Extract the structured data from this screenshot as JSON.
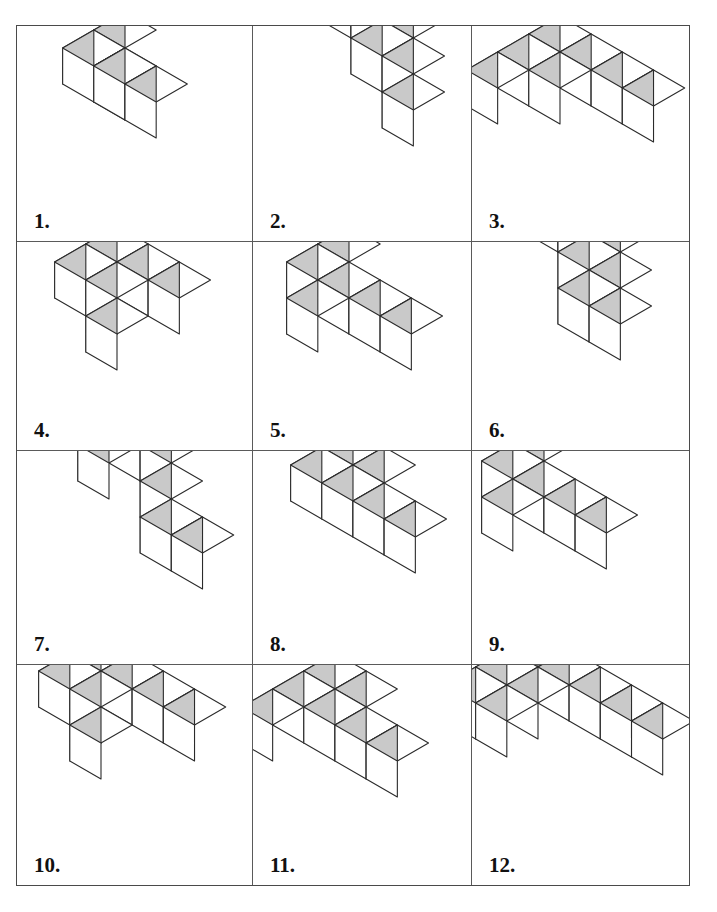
{
  "page": {
    "background_color": "#ffffff",
    "border_color": "#4a4a4a",
    "grid_line_color": "#5a5a5a"
  },
  "figure_style": {
    "top_face_color": "#ffffff",
    "left_face_color": "#c9c9c9",
    "right_face_color": "#ffffff",
    "edge_color": "#2b2b2b",
    "edge_width": 1.1,
    "cube_size_px": 36
  },
  "grid": {
    "columns": 3,
    "rows": 4,
    "cells": [
      {
        "label": "1.",
        "name": "figure-1",
        "origin": [
          108,
          58
        ],
        "cube": 36,
        "voxels": [
          [
            0,
            0,
            1
          ],
          [
            0,
            1,
            1
          ],
          [
            1,
            1,
            1
          ],
          [
            2,
            1,
            1
          ],
          [
            0,
            0,
            0
          ]
        ]
      },
      {
        "label": "2.",
        "name": "figure-2",
        "origin": [
          98,
          48
        ],
        "cube": 36,
        "voxels": [
          [
            0,
            0,
            2
          ],
          [
            1,
            0,
            2
          ],
          [
            2,
            0,
            2
          ],
          [
            1,
            0,
            1
          ],
          [
            2,
            0,
            1
          ],
          [
            2,
            0,
            0
          ]
        ]
      },
      {
        "label": "3.",
        "name": "figure-3",
        "origin": [
          88,
          62
        ],
        "cube": 36,
        "voxels": [
          [
            0,
            2,
            1
          ],
          [
            0,
            1,
            1
          ],
          [
            0,
            0,
            1
          ],
          [
            1,
            0,
            1
          ],
          [
            2,
            0,
            1
          ],
          [
            3,
            0,
            1
          ],
          [
            0,
            0,
            0
          ]
        ]
      },
      {
        "label": "4.",
        "name": "figure-4",
        "origin": [
          100,
          56
        ],
        "cube": 36,
        "voxels": [
          [
            0,
            1,
            1
          ],
          [
            0,
            0,
            1
          ],
          [
            1,
            0,
            1
          ],
          [
            2,
            0,
            1
          ],
          [
            0,
            0,
            0
          ],
          [
            0,
            0,
            -1
          ]
        ]
      },
      {
        "label": "5.",
        "name": "figure-5",
        "origin": [
          96,
          56
        ],
        "cube": 36,
        "voxels": [
          [
            0,
            1,
            1
          ],
          [
            0,
            0,
            1
          ],
          [
            0,
            1,
            0
          ],
          [
            0,
            0,
            0
          ],
          [
            1,
            0,
            0
          ],
          [
            2,
            0,
            0
          ]
        ]
      },
      {
        "label": "6.",
        "name": "figure-6",
        "origin": [
          86,
          46
        ],
        "cube": 36,
        "voxels": [
          [
            0,
            0,
            2
          ],
          [
            1,
            0,
            2
          ],
          [
            2,
            0,
            2
          ],
          [
            1,
            0,
            1
          ],
          [
            2,
            0,
            1
          ],
          [
            1,
            0,
            0
          ],
          [
            2,
            0,
            0
          ]
        ]
      },
      {
        "label": "7.",
        "name": "figure-7",
        "origin": [
          92,
          48
        ],
        "cube": 36,
        "voxels": [
          [
            0,
            0,
            2
          ],
          [
            1,
            0,
            2
          ],
          [
            2,
            0,
            2
          ],
          [
            0,
            0,
            1
          ],
          [
            2,
            0,
            1
          ],
          [
            2,
            0,
            0
          ],
          [
            3,
            0,
            0
          ]
        ]
      },
      {
        "label": "8.",
        "name": "figure-8",
        "origin": [
          100,
          50
        ],
        "cube": 36,
        "voxels": [
          [
            0,
            1,
            1
          ],
          [
            0,
            0,
            1
          ],
          [
            1,
            0,
            1
          ],
          [
            0,
            0,
            0
          ],
          [
            1,
            0,
            0
          ],
          [
            2,
            0,
            0
          ]
        ]
      },
      {
        "label": "9.",
        "name": "figure-9",
        "origin": [
          72,
          46
        ],
        "cube": 36,
        "voxels": [
          [
            0,
            1,
            1
          ],
          [
            0,
            0,
            1
          ],
          [
            0,
            1,
            0
          ],
          [
            0,
            0,
            0
          ],
          [
            1,
            0,
            0
          ],
          [
            2,
            0,
            0
          ]
        ]
      },
      {
        "label": "10.",
        "name": "figure-10",
        "origin": [
          84,
          42
        ],
        "cube": 36,
        "voxels": [
          [
            0,
            1,
            1
          ],
          [
            0,
            0,
            1
          ],
          [
            1,
            0,
            1
          ],
          [
            2,
            0,
            1
          ],
          [
            3,
            0,
            1
          ],
          [
            0,
            0,
            0
          ],
          [
            0,
            0,
            -1
          ]
        ]
      },
      {
        "label": "11.",
        "name": "figure-11",
        "origin": [
          82,
          60
        ],
        "cube": 36,
        "voxels": [
          [
            0,
            2,
            1
          ],
          [
            0,
            1,
            1
          ],
          [
            0,
            0,
            1
          ],
          [
            1,
            0,
            1
          ],
          [
            0,
            0,
            0
          ],
          [
            1,
            0,
            0
          ],
          [
            2,
            0,
            0
          ]
        ]
      },
      {
        "label": "12.",
        "name": "figure-12",
        "origin": [
          66,
          38
        ],
        "cube": 36,
        "voxels": [
          [
            0,
            2,
            1
          ],
          [
            0,
            1,
            1
          ],
          [
            0,
            0,
            1
          ],
          [
            1,
            0,
            1
          ],
          [
            2,
            0,
            1
          ],
          [
            3,
            0,
            1
          ],
          [
            4,
            0,
            1
          ],
          [
            0,
            0,
            0
          ],
          [
            0,
            1,
            0
          ]
        ]
      }
    ]
  }
}
